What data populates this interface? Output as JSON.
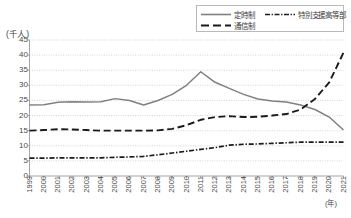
{
  "chart_data": {
    "type": "line",
    "title": "",
    "xlabel": "(年)",
    "ylabel": "(千人)",
    "x": [
      1999,
      2000,
      2001,
      2002,
      2003,
      2004,
      2005,
      2006,
      2007,
      2008,
      2009,
      2010,
      2011,
      2012,
      2013,
      2014,
      2015,
      2016,
      2017,
      2018,
      2019,
      2020,
      2021
    ],
    "xticklabels": [
      "1999",
      "2000",
      "2001",
      "2002",
      "2003",
      "2004",
      "2005",
      "2006",
      "2007",
      "2008",
      "2009",
      "2010",
      "2011",
      "2012",
      "2013",
      "2014",
      "2015",
      "2016",
      "2017",
      "2018",
      "2019",
      "2020",
      "2021"
    ],
    "yticklabels": [
      "0",
      "5",
      "10",
      "15",
      "20",
      "25",
      "30",
      "35",
      "40",
      "45"
    ],
    "ylim": [
      0,
      45
    ],
    "ytick_step": 5,
    "grid": true,
    "legend_position": "top-right",
    "series": [
      {
        "name": "定時制",
        "style": "solid",
        "color": "#808080",
        "values": [
          23.5,
          23.6,
          24.4,
          24.6,
          24.5,
          24.6,
          25.6,
          25.0,
          23.5,
          25.0,
          27.0,
          30.0,
          34.5,
          31.0,
          29.0,
          27.0,
          25.5,
          24.8,
          24.5,
          23.5,
          22.0,
          19.5,
          15.2
        ]
      },
      {
        "name": "特別支援高等部",
        "style": "dashdot",
        "color": "#1a1a1a",
        "values": [
          5.9,
          5.9,
          6.0,
          6.0,
          6.0,
          6.0,
          6.2,
          6.3,
          6.5,
          7.0,
          7.6,
          8.2,
          8.8,
          9.4,
          10.2,
          10.5,
          10.6,
          10.8,
          11.0,
          11.2,
          11.2,
          11.2,
          11.2
        ]
      },
      {
        "name": "通信制",
        "style": "dashed",
        "color": "#1a1a1a",
        "values": [
          15.0,
          15.2,
          15.5,
          15.4,
          15.2,
          15.0,
          15.0,
          15.0,
          15.0,
          15.1,
          15.6,
          16.8,
          18.6,
          19.5,
          19.8,
          19.5,
          19.6,
          20.0,
          20.5,
          22.0,
          25.5,
          31.0,
          40.8
        ]
      }
    ]
  },
  "legend": {
    "items": [
      {
        "label": "定時制",
        "style": "solid"
      },
      {
        "label": "特別支援高等部",
        "style": "dashdot"
      },
      {
        "label": "通信制",
        "style": "dashed"
      }
    ]
  }
}
